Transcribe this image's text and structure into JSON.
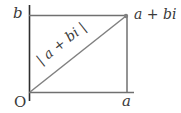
{
  "diagram": {
    "type": "complex-plane-modulus",
    "labels": {
      "origin": "O",
      "real_part": "a",
      "imag_part": "b",
      "point": "a + bi",
      "modulus": "| a + bi |"
    },
    "colors": {
      "axis": "#2e2e2e",
      "line": "#707070",
      "text": "#3a3a3a",
      "point": "#808080"
    },
    "geometry": {
      "origin": [
        30,
        92
      ],
      "point": [
        126,
        16
      ],
      "a_x": 127,
      "b_y": 15
    }
  }
}
